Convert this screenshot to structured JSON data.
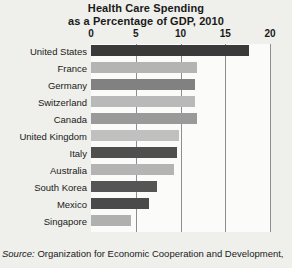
{
  "chart_data": {
    "type": "bar",
    "orientation": "horizontal",
    "title": "Health Care Spending as a Percentage of GDP, 2010",
    "title_lines": [
      "Health Care Spending",
      "as a Percentage of GDP, 2010"
    ],
    "xlabel": "",
    "ylabel": "",
    "xlim": [
      0,
      20
    ],
    "xticks": [
      0,
      5,
      10,
      15,
      20
    ],
    "xtick_labels": [
      "0",
      "5",
      "10",
      "15",
      "20"
    ],
    "grid": true,
    "grid_axis": "x",
    "legend": false,
    "categories": [
      "United States",
      "France",
      "Germany",
      "Switzerland",
      "Canada",
      "United Kingdom",
      "Italy",
      "Australia",
      "South Korea",
      "Mexico",
      "Singapore"
    ],
    "values": [
      17.7,
      11.8,
      11.6,
      11.6,
      11.8,
      9.8,
      9.6,
      9.3,
      7.4,
      6.5,
      4.5
    ],
    "bar_colors": [
      "#3a3a3a",
      "#b4b4b4",
      "#818181",
      "#b9b9b9",
      "#9a9a9a",
      "#c0c0c0",
      "#4f4f4f",
      "#b4b4b4",
      "#555555",
      "#4a4a4a",
      "#b0b0b0"
    ]
  },
  "colors": {
    "page_background": "#efefeb",
    "plot_background": "#fbfbf9",
    "gridline": "#8e8e8e",
    "text": "#1a1a1a"
  },
  "source": {
    "label": "Source:",
    "text": "Organization for Economic Cooperation and Development,"
  }
}
